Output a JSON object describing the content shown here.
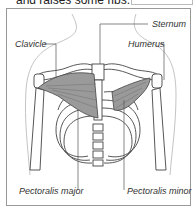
{
  "caption": {
    "partial_text": "and raises some ribs."
  },
  "figure": {
    "labels": {
      "sternum": "Sternum",
      "clavicle": "Clavicle",
      "humerus": "Humerus",
      "pectoralis_major": "Pectoralis major",
      "pectoralis_minor": "Pectoralis minor"
    },
    "colors": {
      "outline": "#444444",
      "muscle": "#8a8a8a",
      "body_outline": "#bbbbbb",
      "frame": "#999999"
    }
  }
}
